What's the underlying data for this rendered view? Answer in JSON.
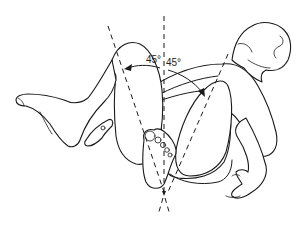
{
  "figure": {
    "background_color": "#ffffff",
    "line_color": "#1a1a1a",
    "annotations": {
      "left_angle_label": "45°",
      "right_angle_label": "45°"
    },
    "elements": [
      "infant-body",
      "infant-head",
      "left-leg-thigh",
      "left-lower-leg-foot",
      "right-thigh",
      "right-foot",
      "left-hand",
      "right-arm-hand",
      "midline-dashed-axis",
      "left-femur-dashed-axis",
      "right-femur-dashed-axis",
      "left-angle-arrow",
      "right-angle-arrow"
    ]
  }
}
